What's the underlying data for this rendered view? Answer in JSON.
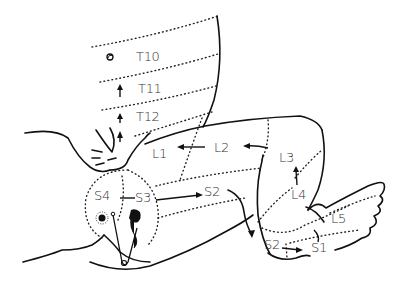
{
  "diagram": {
    "type": "dermatome map",
    "colors": {
      "line": "#111111",
      "text": "#333333",
      "background": "#ffffff"
    },
    "labels": {
      "T10": "T10",
      "T11": "T11",
      "T12": "T12",
      "L1": "L1",
      "L2": "L2",
      "L3": "L3",
      "L4": "L4",
      "L5": "L5",
      "S1": "S1",
      "S2_thigh": "S2",
      "S2_foot": "S2",
      "S3": "S3",
      "S4": "S4"
    },
    "icons": [
      "umbilicus-icon",
      "anus-icon",
      "safety-pin-icon",
      "scrotum-icon"
    ]
  }
}
